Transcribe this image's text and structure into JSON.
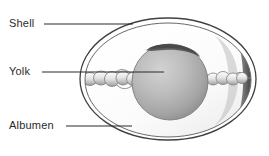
{
  "diagram": {
    "background_color": "#ffffff",
    "line_color": "#3a3a3a",
    "labels": [
      {
        "id": "shell",
        "text": "Shell",
        "target": "eggshell outer layer",
        "leader_from_x": 44,
        "leader_to_x": 133,
        "leader_y": 24
      },
      {
        "id": "yolk",
        "text": "Yolk",
        "target": "central yolk sphere",
        "leader_from_x": 42,
        "leader_to_x": 164,
        "leader_y": 72
      },
      {
        "id": "albumen",
        "text": "Albumen",
        "target": "egg white surrounding yolk",
        "leader_from_x": 66,
        "leader_to_x": 132,
        "leader_y": 126
      }
    ],
    "parts": {
      "shell_outline": {
        "name": "shell",
        "cx": 168,
        "cy": 79,
        "rx": 88,
        "ry": 61,
        "stroke": "#3f3f3f",
        "fill": "#ffffff"
      },
      "membrane_outline": {
        "name": "shell-membrane",
        "cx": 168,
        "cy": 80,
        "rx": 83,
        "ry": 57,
        "stroke": "#555555"
      },
      "albumen": {
        "name": "albumen",
        "fill_light": "#fdfdfd",
        "fill_shadow": "#e9e9e9"
      },
      "yolk": {
        "name": "yolk",
        "cx": 170,
        "cy": 82,
        "r": 38,
        "fill_light": "#c9c9c9",
        "fill_mid": "#a8a8a8",
        "fill_dark": "#8f8f8f",
        "cap_fill": "#4a4a4a"
      },
      "chalaza_left": {
        "name": "chalaza-left",
        "x_start": 82,
        "x_end": 134,
        "y": 79,
        "lobes": 6
      },
      "chalaza_right": {
        "name": "chalaza-right",
        "x_start": 208,
        "x_end": 248,
        "y": 79,
        "lobes": 5
      },
      "air_cell_shadow": {
        "name": "air-cell-shadow",
        "fill": "#5e5e5e"
      }
    }
  }
}
